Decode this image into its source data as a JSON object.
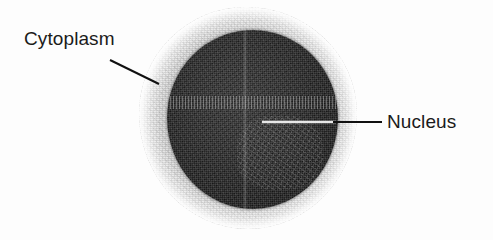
{
  "figure": {
    "kind": "light-micrograph-cell-diagram",
    "background_color": "#fdfdfd",
    "label_text_color": "#1b1b1b",
    "leader_line_color": "#111111",
    "leader_line_color_over_nucleus": "#e8e8e8"
  },
  "labels": [
    {
      "id": "cytoplasm",
      "text": "Cytoplasm",
      "text_x": 24,
      "text_y": 29,
      "leader": {
        "x1": 110,
        "y1": 60,
        "x2": 159,
        "y2": 84
      }
    },
    {
      "id": "nucleus",
      "text": "Nucleus",
      "text_x": 387,
      "text_y": 112,
      "leader": {
        "x1": 262,
        "y1": 122,
        "x2": 382,
        "y2": 122
      }
    }
  ],
  "structures": {
    "cytoplasm": {
      "name": "Cytoplasm",
      "fill_color": "#dddddd",
      "bounds": {
        "x": 139,
        "y": 7,
        "width": 218,
        "height": 222
      }
    },
    "nucleus": {
      "name": "Nucleus",
      "fill_color": "#2b2b2b",
      "bounds": {
        "x": 167,
        "y": 30,
        "width": 171,
        "height": 179
      }
    }
  }
}
